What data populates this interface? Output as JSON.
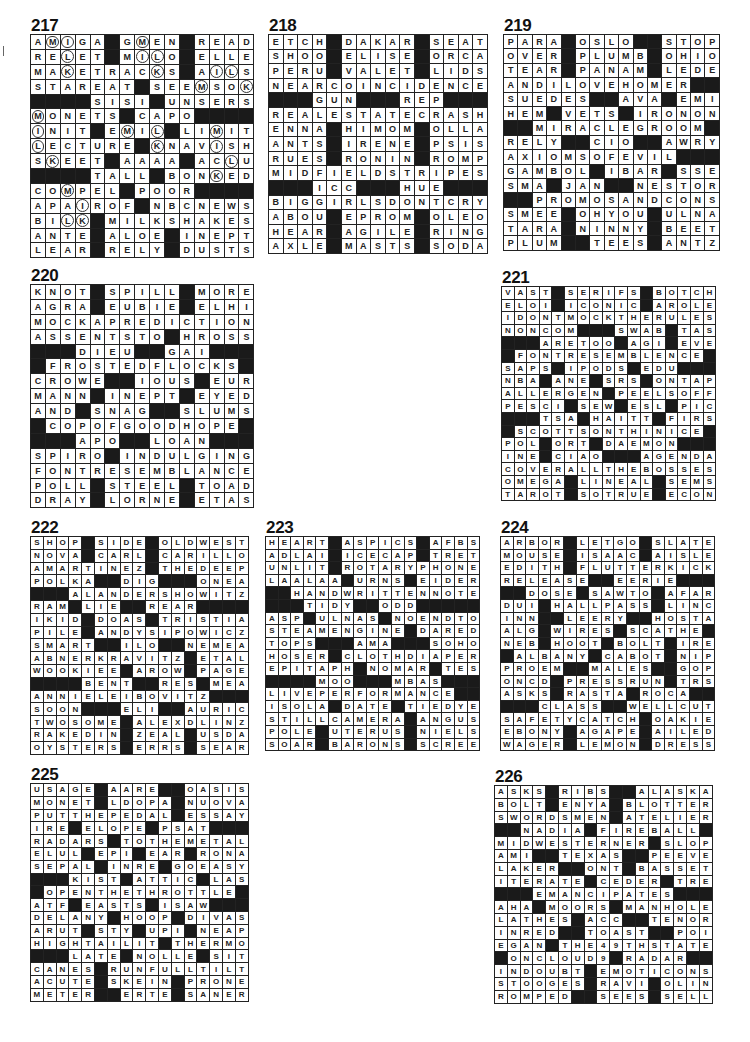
{
  "puzzles": [
    {
      "number": "217",
      "size": 15,
      "x": 32,
      "y": 20,
      "cell": 14.9,
      "rows": [
        "AMIGA#GMEN#READ",
        "RELET#MILO#ELLE",
        "MAKETRACKS#AILS",
        "STAREAT#SEEMSOK",
        "####SISI#UNSERS",
        "MONETS#CAPO####",
        "INIT#EMIL#LIMIT",
        "LECTURE#KNAVISH",
        "SKEET#AAAA#ACLU",
        "####TALL#BONKED",
        "COMPEL#POOR####",
        "APAIROF#NBCNEWS",
        "BILK#MILKSHAKES",
        "ANTE#ALOE#INEPT",
        "LEAR#RELY#DUSTS"
      ],
      "circles": [
        [
          0,
          1
        ],
        [
          0,
          2
        ],
        [
          0,
          7
        ],
        [
          1,
          2
        ],
        [
          1,
          7
        ],
        [
          1,
          8
        ],
        [
          2,
          2
        ],
        [
          2,
          8
        ],
        [
          2,
          12
        ],
        [
          2,
          13
        ],
        [
          3,
          11
        ],
        [
          3,
          14
        ],
        [
          5,
          0
        ],
        [
          6,
          0
        ],
        [
          6,
          6
        ],
        [
          6,
          8
        ],
        [
          6,
          12
        ],
        [
          7,
          0
        ],
        [
          7,
          8
        ],
        [
          7,
          12
        ],
        [
          8,
          1
        ],
        [
          8,
          13
        ],
        [
          9,
          12
        ],
        [
          10,
          2
        ],
        [
          11,
          3
        ],
        [
          12,
          2
        ],
        [
          12,
          3
        ]
      ]
    },
    {
      "number": "218",
      "size": 15,
      "x": 270,
      "y": 20,
      "cell": 14.6,
      "rows": [
        "ETCH#DAKAR#SEAT",
        "SHOO#ELISE#ORCA",
        "PERU#VALET#LIDS",
        "NEARCOINCIDENCE",
        "###GUN###REP###",
        "REALESTATECRASH",
        "ENNA#HIMOM#OLLA",
        "ANTS#IRENE#PSIS",
        "RUES#RONIN#ROMP",
        "MIDFIELDSTRIPES",
        "###ICC###HUE###",
        "BIGGIRLSDONTCRY",
        "ABOU#EPROM#OLEO",
        "HEAR#AGILE#RING",
        "AXLE#MASTS#SODA"
      ],
      "circles": []
    },
    {
      "number": "219",
      "size": 15,
      "x": 505,
      "y": 20,
      "cell": 14.4,
      "rows": [
        "PARA#OSLO##STOP",
        "OVER#PLUMB#OHIO",
        "TEAR#PANAM#LEDE",
        "ANDILOVEHOMER##",
        "SUEDES##AVA#EMI",
        "HEM#VETS#IRONON",
        "##MIRACLEGROOM",
        "RELY##CIO##AWRY",
        "AXIOMSOFEVIL###",
        "GAMBOL#IBAR#SSE",
        "SMA#JAN##NESTOR",
        "##PROMOSANDCONS",
        "SMEE#OHYOU#ULNA",
        "TARA#NINNY#BEET",
        "PLUM##TEES#ANTZ"
      ],
      "circles": []
    },
    {
      "number": "220",
      "size": 15,
      "x": 32,
      "y": 270,
      "cell": 14.9,
      "rows": [
        "KNOT#SPILL#MORE",
        "AGRA#EUBIE#ELHI",
        "MOCKAPREDICTION",
        "ASSENTSTO#HROSS",
        "###DIEU##GAI###",
        "#FROSTEDFLOCKS#",
        "CROWE##IOUS#EUR",
        "MANN#INEPT#EYED",
        "AND#SNAG##SLUMS",
        "#COPOFGOODHOPE#",
        "###APO##LOAN###",
        "SPIRO#INDULGING",
        "FONTRESEMBLANCE",
        "POLL#STEEL#TOAD",
        "DRAY#LORNE#ETAS"
      ],
      "circles": []
    },
    {
      "number": "221",
      "size": 17,
      "x": 503,
      "y": 272,
      "cell": 12.6,
      "rows": [
        "VAST#SERIFS#BOTCH",
        "ELOI#ICONIC#AROLE",
        "IDONTMOCKTHERULES",
        "NONCOM###SWAB#TAS",
        "###ARETOO#AGI#EVE",
        "#FONTRESEMBLENCE#",
        "SAPS#IPODS#EDU###",
        "NBA#ANE#SRS#ONTAP",
        "ALLERGEN#PEELSOFF",
        "PESCI#SEW#ESL#PIC",
        "###TSA#HAITT#FIRS",
        "#SCOTTSONTHINICE#",
        "POL#ORT#DAEMON###",
        "INE#CIAO###AGENDA",
        "COVERALLTHEBOSSES",
        "OMEGA#LINEAL#SEMS",
        "TAROT#SOTRUE#ECON"
      ],
      "circles": []
    },
    {
      "number": "222",
      "size": 17,
      "x": 32,
      "y": 522,
      "cell": 12.8,
      "rows": [
        "SHOP#SIDE#OLDWEST",
        "NOVA#CARL#CARILLO",
        "AMARTINEZ#THEDEEP",
        "POLKA##DIG###ONEA",
        "###ALANDERSHOWITZ",
        "RAM#LIE##REAR####",
        "IKID#DOAS#TRISTIA",
        "PILE#ANDYSIPOWICZ",
        "SMART##ILO##NEMEA",
        "ABNERKRAVITZ#ETAL",
        "WOOKIEE#AROW#PAGE",
        "####BENT##RES#MEA",
        "ANNIELEIBOVITZ###",
        "SOON###ELI##AURIC",
        "TWOSOME#ALEXDLINZ",
        "RAKEDIN#ZEAL#USDA",
        "OYSTERS#ERRS#SEAR"
      ],
      "circles": []
    },
    {
      "number": "223",
      "size": 17,
      "x": 267,
      "y": 522,
      "cell": 12.6,
      "rows": [
        "HEART#ASPICS#AFBS",
        "ADLAI#ICECAP#TRET",
        "UNLIT#ROTARYPHONE",
        "LAALAA#URNS#EIDER",
        "##HANDWRITTENNOTE",
        "###TIDY##ODD#####",
        "ASP#ULNAS#NOENDTO",
        "STEAMENGINE#DARED",
        "TOPS###AMA###SOHO",
        "HOSER#CLOTHDIAPER",
        "EPITAPH#NOMAR#TES",
        "####MOO###MBAS###",
        "LIVEPERFORMANCE##",
        "ISOLA#DATE#TIEDYE",
        "STILLCAMERA#ANGUS",
        "POLE#UTERUS#NIELS",
        "SOAR#BARONS#SCREE"
      ],
      "circles": []
    },
    {
      "number": "224",
      "size": 17,
      "x": 502,
      "y": 522,
      "cell": 12.6,
      "rows": [
        "ARBOR#LETGO#SLATE",
        "MOUSE#ISAAC#AISLE",
        "EDITH#FLUTTERKICK",
        "RELEASE##EERIE###",
        "##DOSE#SAWTO#AFAR",
        "DUI#HALLPASS#LINC",
        "INN##LEERY##HOSTA",
        "ALG#WIRES#SCATHE#",
        "NEB#HOOT#BOLT#IRE",
        "#ALBANY#CABOT#NIP",
        "PROEM##MALES##GOP",
        "ONCD#PRESSRUN#TRS",
        "ASKS#RASTA#ROCA##",
        "###CLASS##WELLCUT",
        "SAFETYCATCH#OAKIE",
        "EBONY#AGAPE#AILED",
        "WAGER#LEMON#DRESS"
      ],
      "circles": []
    },
    {
      "number": "225",
      "size": 17,
      "x": 32,
      "y": 769,
      "cell": 12.8,
      "rows": [
        "USAGE#AARE##OASIS",
        "MONET#LDOPA#NUOVA",
        "PUTTHEPEDAL#ESSAY",
        "IRE#ELOPE#PSAT###",
        "RADARS#TOTHEMETAL",
        "ELUL#EPI#EAR#RONA",
        "SEPAL#INRE#GOEASY",
        "###KIST#ATTIC#LAS",
        "#OPENTHETHROTTLE#",
        "ATF#EASTS#ISAW###",
        "DELANY#HOOP#DIVAS",
        "ARUT#STY#UPI#NEAP",
        "HIGHTAILIT#THERMO",
        "###LATE#NOLLE#SIT",
        "CANES#RUNFULLTILT",
        "ACUTE#SKEIN#PRONE",
        "METER##ERTE#SANER"
      ],
      "circles": []
    },
    {
      "number": "226",
      "size": 17,
      "x": 496,
      "y": 771,
      "cell": 12.8,
      "rows": [
        "ASKS#RIBS##ALASKA",
        "BOLT#ENYA#BLOTTER",
        "SWORDSMEN#ATELIER",
        "##NADIA#FIREBALL#",
        "MIDWESTERNER#SLOP",
        "AMI##TEXAS##PEEVE",
        "LAKER##ONT#BASSET",
        "ITERATE#CEDER#TRE",
        "###EMANCIPATES###",
        "AHA#MOORS#MANHOLE",
        "LATHES#ACC##TENOR",
        "INRED##TOAST##POI",
        "EGAN#THE49THSTATE",
        "#ONCLOUD9#RADAR##",
        "INDOUBT#EMOTICONS",
        "STOOGES#RAVI#OLIN",
        "ROMPED##SEES#SELL"
      ],
      "circles": []
    }
  ]
}
